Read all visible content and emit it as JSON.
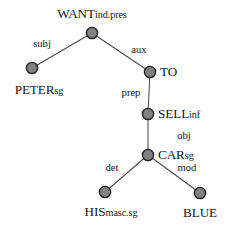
{
  "diagram": {
    "type": "dependency-tree",
    "sentence": "Peter wants to sell his blue car",
    "node_fill_color": "#818181",
    "node_stroke_color": "#1c1c1c",
    "edge_color": "#4a4a4a",
    "text_color": "#161616",
    "background_color": "#ffffff",
    "nodes": [
      {
        "id": "want",
        "base": "WANT",
        "sub": "ind.pres",
        "full_label": "WANTind.pres",
        "x": 92,
        "y": 33,
        "label_x": 92,
        "label_y": 14,
        "label_anchor": "center"
      },
      {
        "id": "peter",
        "base": "PETER",
        "sub": "sg",
        "full_label": "PETERsg",
        "x": 32,
        "y": 68,
        "label_x": 39,
        "label_y": 90,
        "label_anchor": "center"
      },
      {
        "id": "to",
        "base": "TO",
        "sub": "",
        "full_label": "TO",
        "x": 150,
        "y": 72,
        "label_x": 160,
        "label_y": 72,
        "label_anchor": "left"
      },
      {
        "id": "sell",
        "base": "SELL",
        "sub": "inf",
        "full_label": "SELLinf",
        "x": 148,
        "y": 114,
        "label_x": 158,
        "label_y": 114,
        "label_anchor": "left"
      },
      {
        "id": "car",
        "base": "CAR",
        "sub": "sg",
        "full_label": "CARsg",
        "x": 148,
        "y": 155,
        "label_x": 158,
        "label_y": 155,
        "label_anchor": "left"
      },
      {
        "id": "his",
        "base": "HIS",
        "sub": "masc.sg",
        "full_label": "HISmasc.sg",
        "x": 105,
        "y": 192,
        "label_x": 111,
        "label_y": 212,
        "label_anchor": "center"
      },
      {
        "id": "blue",
        "base": "BLUE",
        "sub": "",
        "full_label": "BLUE",
        "x": 200,
        "y": 193,
        "label_x": 200,
        "label_y": 213,
        "label_anchor": "center"
      }
    ],
    "edges": [
      {
        "id": "want-peter",
        "from": "want",
        "to": "peter",
        "label": "subj",
        "x1": 92,
        "y1": 33,
        "x2": 32,
        "y2": 68,
        "label_x": 42,
        "label_y": 44
      },
      {
        "id": "want-to",
        "from": "want",
        "to": "to",
        "label": "aux",
        "x1": 92,
        "y1": 33,
        "x2": 150,
        "y2": 72,
        "label_x": 139,
        "label_y": 50
      },
      {
        "id": "to-sell",
        "from": "to",
        "to": "sell",
        "label": "prep",
        "x1": 150,
        "y1": 72,
        "x2": 148,
        "y2": 114,
        "label_x": 131,
        "label_y": 93
      },
      {
        "id": "sell-car",
        "from": "sell",
        "to": "car",
        "label": "obj",
        "x1": 148,
        "y1": 114,
        "x2": 148,
        "y2": 155,
        "label_x": 184,
        "label_y": 136
      },
      {
        "id": "car-his",
        "from": "car",
        "to": "his",
        "label": "det",
        "x1": 148,
        "y1": 155,
        "x2": 105,
        "y2": 192,
        "label_x": 112,
        "label_y": 168
      },
      {
        "id": "car-blue",
        "from": "car",
        "to": "blue",
        "label": "mod",
        "x1": 148,
        "y1": 155,
        "x2": 200,
        "y2": 193,
        "label_x": 187,
        "label_y": 168
      }
    ]
  }
}
